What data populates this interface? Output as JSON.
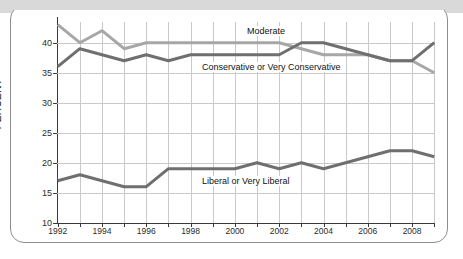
{
  "chart_data": {
    "type": "line",
    "title": "",
    "xlabel": "",
    "ylabel": "PERCENT",
    "xlim": [
      1992,
      2009
    ],
    "ylim": [
      10,
      45
    ],
    "grid": true,
    "legend_position": "inline-labels",
    "x": [
      1992,
      1993,
      1994,
      1995,
      1996,
      1997,
      1998,
      1999,
      2000,
      2001,
      2002,
      2003,
      2004,
      2005,
      2006,
      2007,
      2008,
      2009
    ],
    "y_ticks": [
      10,
      15,
      20,
      25,
      30,
      35,
      40
    ],
    "x_ticks": [
      1992,
      1994,
      1996,
      1998,
      2000,
      2002,
      2004,
      2006,
      2008
    ],
    "x_tick_labels": [
      "1992",
      "1994",
      "1996",
      "1998",
      "2000",
      "2002",
      "2004",
      "2006",
      "2008"
    ],
    "y_tick_labels": [
      "10",
      "15",
      "20",
      "25",
      "30",
      "35",
      "40"
    ],
    "series": [
      {
        "name": "Moderate",
        "color": "#a7a7a7",
        "values": [
          43,
          40,
          42,
          39,
          40,
          40,
          40,
          40,
          40,
          40,
          40,
          39,
          38,
          38,
          38,
          37,
          37,
          35
        ]
      },
      {
        "name": "Conservative or Very Conservative",
        "color": "#6f6f6f",
        "values": [
          36,
          39,
          38,
          37,
          38,
          37,
          38,
          38,
          38,
          38,
          38,
          40,
          40,
          39,
          38,
          37,
          37,
          40
        ]
      },
      {
        "name": "Liberal or Very Liberal",
        "color": "#6f6f6f",
        "values": [
          17,
          18,
          17,
          16,
          16,
          19,
          19,
          19,
          19,
          20,
          19,
          20,
          19,
          20,
          21,
          22,
          22,
          21
        ]
      }
    ],
    "annotations": [
      {
        "text": "Moderate",
        "x": 245,
        "y": 26
      },
      {
        "text": "Conservative or Very Conservative",
        "x": 200,
        "y": 62
      },
      {
        "text": "Liberal or Very Liberal",
        "x": 200,
        "y": 176
      }
    ]
  },
  "figure": {
    "background": "#ffffff",
    "strip_color": "#d9d9d9",
    "frame_color": "#8e8e8e",
    "grid_color": "#c9c9c9",
    "axis_color": "#3a3a3a"
  }
}
